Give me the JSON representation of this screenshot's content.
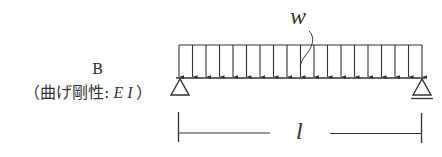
{
  "diagram": {
    "type": "simply-supported-beam",
    "beam_label": "B",
    "stiffness_label": "（曲げ剛性: E I）",
    "stiffness_prefix": "（曲げ剛性:",
    "stiffness_value": "E I",
    "stiffness_suffix": "）",
    "load_label": "w",
    "load_type": "uniformly distributed load",
    "span_label": "l",
    "left_support": "pin",
    "right_support": "roller",
    "arrow_count": 19,
    "colors": {
      "line": "#333333",
      "background": "#ffffff"
    }
  }
}
